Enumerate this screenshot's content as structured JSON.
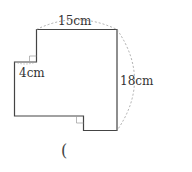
{
  "figure": {
    "labels": {
      "top": "15cm",
      "right": "18cm",
      "step": "4cm"
    },
    "answer_bracket": "("
  },
  "colors": {
    "stroke": "#444444",
    "dashed": "#999999"
  }
}
